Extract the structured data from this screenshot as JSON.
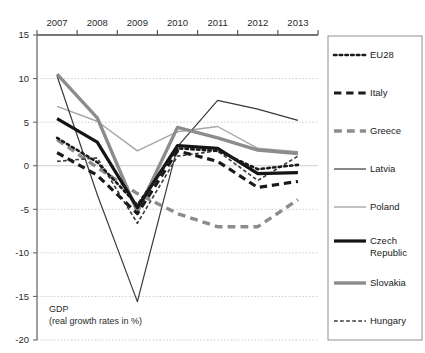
{
  "chart_data": {
    "type": "line",
    "title": "",
    "caption_line1": "GDP",
    "caption_line2": "(real growth rates in %)",
    "xlabel": "",
    "ylabel": "",
    "categories": [
      "2007",
      "2008",
      "2009",
      "2010",
      "2011",
      "2012",
      "2013"
    ],
    "ylim": [
      -20,
      15
    ],
    "yticks": [
      15,
      10,
      5,
      0,
      -5,
      -10,
      -15,
      -20
    ],
    "ytick_labels": [
      "15",
      "10",
      "5",
      "0",
      "-5",
      "-10",
      "-15",
      "-20"
    ],
    "grid": true,
    "grid_axis": "y",
    "xaxis_position": "top",
    "legend_position": "right",
    "series": [
      {
        "name": "EU28",
        "values": [
          3.2,
          0.4,
          -4.5,
          2.0,
          1.7,
          -0.4,
          0.1
        ],
        "color": "#1a1a1a",
        "width": 2.6,
        "style": "dotted"
      },
      {
        "name": "Italy",
        "values": [
          1.5,
          -1.1,
          -5.5,
          1.7,
          0.5,
          -2.5,
          -1.8
        ],
        "color": "#1a1a1a",
        "width": 3.2,
        "style": "dashed"
      },
      {
        "name": "Greece",
        "values": [
          3.0,
          -0.2,
          -3.2,
          -5.5,
          -7.0,
          -7.0,
          -3.9
        ],
        "color": "#8c8c8c",
        "width": 3.4,
        "style": "dashed"
      },
      {
        "name": "Latvia",
        "values": [
          10.3,
          -3.3,
          -15.6,
          2.2,
          7.5,
          6.5,
          5.2
        ],
        "color": "#3a3a3a",
        "width": 1.2,
        "style": "solid"
      },
      {
        "name": "Poland",
        "values": [
          6.8,
          5.1,
          1.7,
          3.9,
          4.5,
          2.0,
          1.6
        ],
        "color": "#a6a6a6",
        "width": 1.4,
        "style": "solid"
      },
      {
        "name": "Czech Republic",
        "values": [
          5.4,
          2.7,
          -4.8,
          2.3,
          2.0,
          -0.9,
          -0.8
        ],
        "color": "#141414",
        "width": 3.2,
        "style": "solid"
      },
      {
        "name": "Slovakia",
        "values": [
          10.5,
          5.5,
          -5.3,
          4.4,
          3.2,
          1.8,
          1.4
        ],
        "color": "#8c8c8c",
        "width": 3.4,
        "style": "solid"
      },
      {
        "name": "Hungary",
        "values": [
          0.5,
          0.9,
          -6.6,
          1.1,
          1.7,
          -1.7,
          1.1
        ],
        "color": "#3a3a3a",
        "width": 1.6,
        "style": "dashed"
      }
    ]
  },
  "legend": {
    "items": [
      {
        "label": "EU28"
      },
      {
        "label": "Italy"
      },
      {
        "label": "Greece"
      },
      {
        "label": "Latvia"
      },
      {
        "label": "Poland"
      },
      {
        "label": "Czech Republic"
      },
      {
        "label": "Slovakia"
      },
      {
        "label": "Hungary"
      }
    ]
  }
}
